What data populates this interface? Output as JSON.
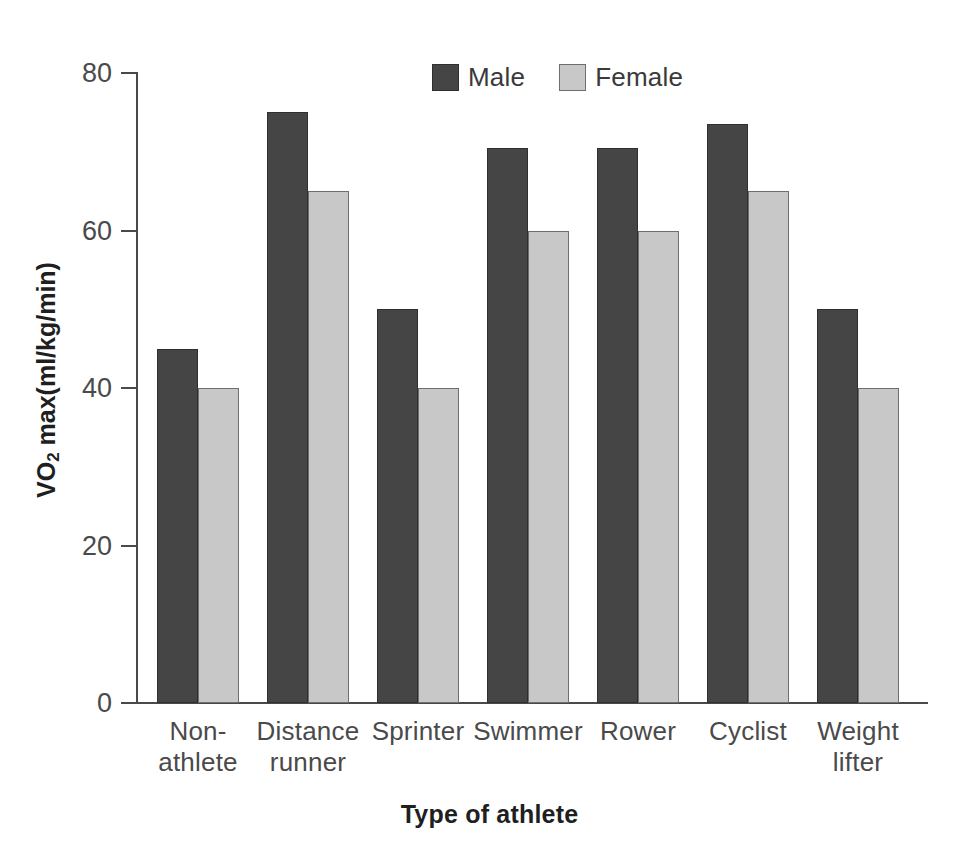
{
  "chart_data": {
    "type": "bar",
    "title": "",
    "xlabel": "Type of athlete",
    "ylabel": "VO2 max(ml/kg/min)",
    "ylabel_main": "VO",
    "ylabel_sub": "2",
    "ylabel_rest": " max(ml/kg/min)",
    "categories": [
      "Non-athlete",
      "Distance runner",
      "Sprinter",
      "Swimmer",
      "Rower",
      "Cyclist",
      "Weight lifter"
    ],
    "category_lines": [
      [
        "Non-",
        "athlete"
      ],
      [
        "Distance",
        "runner"
      ],
      [
        "Sprinter",
        ""
      ],
      [
        "Swimmer",
        ""
      ],
      [
        "Rower",
        ""
      ],
      [
        "Cyclist",
        ""
      ],
      [
        "Weight",
        "lifter"
      ]
    ],
    "series": [
      {
        "name": "Male",
        "color": "#454545",
        "values": [
          45,
          75,
          50,
          70.5,
          70.5,
          73.5,
          50
        ]
      },
      {
        "name": "Female",
        "color": "#c8c8c8",
        "values": [
          40,
          65,
          40,
          60,
          60,
          65,
          40
        ]
      }
    ],
    "ylim": [
      0,
      80
    ],
    "yticks": [
      0,
      20,
      40,
      60,
      80
    ],
    "ytick_labels": [
      "0",
      "20",
      "40",
      "60",
      "80"
    ],
    "grid": false,
    "legend_position": "top-center"
  },
  "legend": {
    "entries": [
      {
        "label": "Male",
        "color": "#454545"
      },
      {
        "label": "Female",
        "color": "#c8c8c8"
      }
    ]
  },
  "colors": {
    "male": "#454545",
    "female": "#c8c8c8",
    "axis": "#4a4a4a",
    "text": "#3a3a3a",
    "title_text": "#1f1f1f",
    "background": "#ffffff"
  }
}
